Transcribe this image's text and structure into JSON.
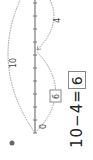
{
  "number_line": {
    "min": 0,
    "max": 10,
    "ticks": 11,
    "start_label": "0"
  },
  "arcs": [
    {
      "from": 0,
      "to": 10,
      "label": "10",
      "position": "above"
    },
    {
      "from": 10,
      "to": 6,
      "label": "4",
      "position": "below"
    },
    {
      "from": 0,
      "to": 6,
      "label": "6",
      "position": "below",
      "boxed": true
    }
  ],
  "equation": {
    "a": "10",
    "op": "−",
    "b": "4",
    "eq": "=",
    "result": "6"
  },
  "colors": {
    "line": "#777777",
    "arc": "#999999",
    "text": "#222222"
  }
}
